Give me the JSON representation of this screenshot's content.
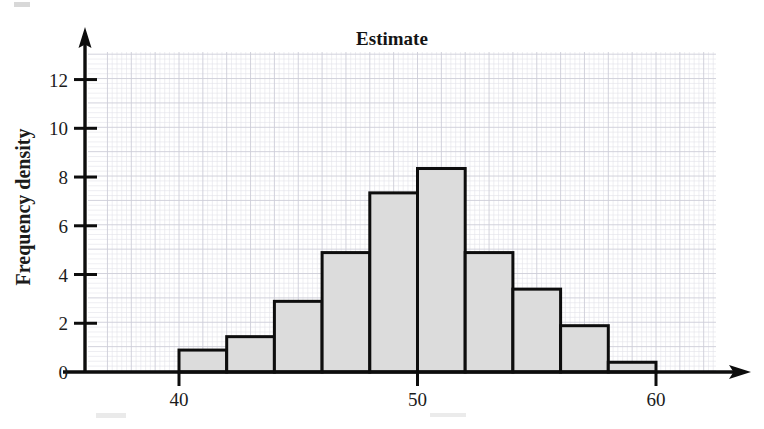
{
  "chart_data": {
    "type": "bar",
    "title": "Estimate",
    "xlabel": "",
    "ylabel": "Frequency density",
    "subtitle": "",
    "grid": true,
    "legend": "none",
    "xlim": [
      36.5,
      64.5
    ],
    "ylim": [
      0,
      13
    ],
    "xticks": [
      40,
      50,
      60
    ],
    "xtick_labels": [
      "40",
      "50",
      "60"
    ],
    "yticks": [
      0,
      2,
      4,
      6,
      8,
      10,
      12
    ],
    "ytick_labels": [
      "0",
      "2",
      "4",
      "6",
      "8",
      "10",
      "12"
    ],
    "bin_edges": [
      40,
      42,
      44,
      46,
      48,
      50,
      52,
      54,
      56,
      58,
      60
    ],
    "categories": [
      "40-42",
      "42-44",
      "44-46",
      "46-48",
      "48-50",
      "50-52",
      "52-54",
      "54-56",
      "56-58",
      "58-60"
    ],
    "values": [
      0.9,
      1.45,
      2.9,
      4.9,
      7.35,
      8.35,
      4.9,
      3.4,
      1.9,
      0.4
    ],
    "bar_fill": "#dcdcdc",
    "bar_edge": "#0d0d0d",
    "axis_color": "#0d0d0d",
    "grid_color": "#e2e2ea"
  },
  "axes": {
    "y_axis_title": "Frequency density",
    "x_axis_title": ""
  },
  "figure": {
    "title": "Estimate",
    "background": "#ffffff"
  }
}
